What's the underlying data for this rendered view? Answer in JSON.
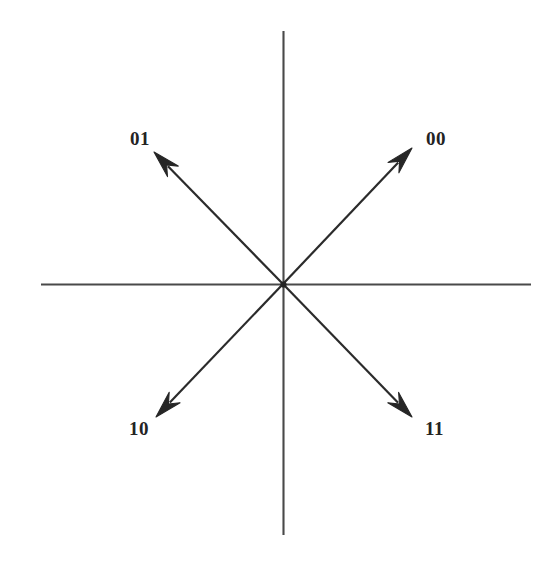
{
  "figure": {
    "kind": "signal-constellation-diagram",
    "background_color": "#ffffff",
    "ink_color": "#2b2b2b",
    "label_color": "#232323",
    "canvas": {
      "width": 559,
      "height": 567
    }
  },
  "chart_data": {
    "type": "scatter",
    "title": "",
    "subtitle": "",
    "xlabel": "",
    "ylabel": "",
    "grid": false,
    "legend": "none",
    "axes": {
      "origin": {
        "x": 283,
        "y": 284
      },
      "horizontal": {
        "x1": 41,
        "y1": 284,
        "x2": 531,
        "y2": 284,
        "arrowheads": false,
        "ticks": [],
        "tick_labels": []
      },
      "vertical": {
        "x1": 283,
        "y1": 31,
        "x2": 283,
        "y2": 535,
        "arrowheads": false,
        "ticks": [],
        "tick_labels": []
      },
      "xlim": [
        -1.5,
        1.5
      ],
      "ylim": [
        -1.5,
        1.5
      ]
    },
    "vector_magnitude": 1.0,
    "series": [
      {
        "name": "QPSK symbol phasors",
        "points": [
          {
            "label": "00",
            "angle_deg": 45,
            "x": 0.707,
            "y": 0.707,
            "quadrant": "upper-right"
          },
          {
            "label": "01",
            "angle_deg": 135,
            "x": -0.707,
            "y": 0.707,
            "quadrant": "upper-left"
          },
          {
            "label": "10",
            "angle_deg": 225,
            "x": -0.707,
            "y": -0.707,
            "quadrant": "lower-left"
          },
          {
            "label": "11",
            "angle_deg": 315,
            "x": 0.707,
            "y": -0.707,
            "quadrant": "lower-right"
          }
        ]
      }
    ]
  },
  "vectors": [
    {
      "id": "vector-00",
      "label": "00",
      "angle_deg": 45,
      "line": {
        "x1": 283,
        "y1": 284,
        "x2": 404,
        "y2": 156
      },
      "tip": {
        "x": 412,
        "y": 148
      },
      "label_pos": {
        "x": 426,
        "y": 129
      }
    },
    {
      "id": "vector-01",
      "label": "01",
      "angle_deg": 135,
      "line": {
        "x1": 283,
        "y1": 284,
        "x2": 163,
        "y2": 160
      },
      "tip": {
        "x": 154,
        "y": 152
      },
      "label_pos": {
        "x": 130,
        "y": 129
      }
    },
    {
      "id": "vector-10",
      "label": "10",
      "angle_deg": 225,
      "line": {
        "x1": 283,
        "y1": 284,
        "x2": 165,
        "y2": 408
      },
      "tip": {
        "x": 156,
        "y": 417
      },
      "label_pos": {
        "x": 129,
        "y": 419
      }
    },
    {
      "id": "vector-11",
      "label": "11",
      "angle_deg": 315,
      "line": {
        "x1": 283,
        "y1": 284,
        "x2": 403,
        "y2": 408
      },
      "tip": {
        "x": 412,
        "y": 417
      },
      "label_pos": {
        "x": 425,
        "y": 419
      }
    }
  ]
}
